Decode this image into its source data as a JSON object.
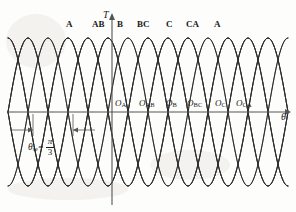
{
  "figure": {
    "kind": "torque-angle-curve-diagram",
    "background_color": "#fdfdfb",
    "line_color": "#2b2b2b",
    "axis_color": "#555555",
    "text_color": "#1a1a1a"
  },
  "axes": {
    "y_axis_label": "T",
    "x_axis_label": "θ",
    "origin_x_px": 112,
    "baseline_y_px": 112,
    "x_arrow": true,
    "y_arrow": true
  },
  "phase_labels": [
    {
      "text": "A",
      "x": 66,
      "y": 20
    },
    {
      "text": "AB",
      "x": 92,
      "y": 20
    },
    {
      "text": "B",
      "x": 117,
      "y": 20
    },
    {
      "text": "BC",
      "x": 137,
      "y": 20
    },
    {
      "text": "C",
      "x": 166,
      "y": 20
    },
    {
      "text": "CA",
      "x": 186,
      "y": 20
    },
    {
      "text": "A",
      "x": 214,
      "y": 20
    }
  ],
  "origin_labels": [
    {
      "base": "O",
      "sub": "A",
      "x": 115,
      "y": 99
    },
    {
      "base": "O",
      "sub": "AB",
      "x": 139,
      "y": 99
    },
    {
      "base": "O",
      "sub": "B",
      "x": 166,
      "y": 99
    },
    {
      "base": "O",
      "sub": "BC",
      "x": 187,
      "y": 99
    },
    {
      "base": "O",
      "sub": "C",
      "x": 215,
      "y": 99
    },
    {
      "base": "O",
      "sub": "CA",
      "x": 236,
      "y": 99
    }
  ],
  "annotation": {
    "symbol": "θ",
    "symbol_sub": "se",
    "equals": "=",
    "fraction_numerator": "π",
    "fraction_denominator": "3",
    "dimension_from_x_px": 33,
    "dimension_to_x_px": 73,
    "dimension_y_px": 130
  },
  "chart_data": {
    "type": "line",
    "title": "",
    "xlabel": "θ",
    "ylabel": "T",
    "grid": false,
    "legend": "none",
    "x_range_px": [
      8,
      288
    ],
    "amplitude_px": 74,
    "baseline_y_px": 112,
    "period_px": 80,
    "phase_step_px": 20,
    "num_curves": 11,
    "first_peak_x_px": 68,
    "series": [
      {
        "name": "A",
        "peak_x_px": 68,
        "zero_up_x_px": 28
      },
      {
        "name": "AB",
        "peak_x_px": 88,
        "zero_up_x_px": 48
      },
      {
        "name": "B",
        "peak_x_px": 108,
        "zero_up_x_px": 68
      },
      {
        "name": "BC",
        "peak_x_px": 128,
        "zero_up_x_px": 88
      },
      {
        "name": "C",
        "peak_x_px": 148,
        "zero_up_x_px": 108
      },
      {
        "name": "CA",
        "peak_x_px": 168,
        "zero_up_x_px": 128
      },
      {
        "name": "A2",
        "peak_x_px": 188,
        "zero_up_x_px": 148
      },
      {
        "name": "AB2",
        "peak_x_px": 208,
        "zero_up_x_px": 168
      },
      {
        "name": "B2",
        "peak_x_px": 228,
        "zero_up_x_px": 188
      },
      {
        "name": "BC2",
        "peak_x_px": 248,
        "zero_up_x_px": 208
      },
      {
        "name": "C2",
        "peak_x_px": 268,
        "zero_up_x_px": 228
      }
    ]
  }
}
